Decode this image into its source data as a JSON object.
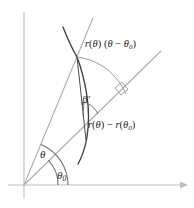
{
  "figure": {
    "background_color": "#ffffff",
    "axis_color": "#b8b8b8",
    "ray_color": "#a8a8a8",
    "curve_color": "#3c3c3c",
    "arc_color": "#8a8a8a",
    "text_color": "#1c1c1c",
    "width": 194,
    "height": 208
  },
  "labels": {
    "arc_length": {
      "function_name": "r",
      "argument": "θ",
      "full_text": "r(θ) (θ − θ₀)",
      "theta": "θ",
      "minus": "−",
      "theta_sub": "0",
      "open_paren": "(",
      "close_paren": ")"
    },
    "radial_difference": {
      "full_text": "r(θ) − r(θ₀)",
      "function_name": "r",
      "theta": "θ",
      "minus": "−",
      "theta_sub": "0"
    },
    "beta_prime": {
      "text": "β′",
      "base": "β",
      "prime": "′"
    },
    "theta": {
      "text": "θ"
    },
    "theta_zero": {
      "base": "θ",
      "subscript": "0",
      "text": "θ₀"
    }
  },
  "geometry": {
    "origin": {
      "x": 24,
      "y": 185
    },
    "x_axis": {
      "x1": 8,
      "y1": 185,
      "x2": 186,
      "y2": 185,
      "arrow": "right"
    },
    "y_axis": {
      "x1": 24,
      "y1": 12,
      "x2": 24,
      "y2": 199,
      "arrow": "none"
    },
    "theta_ray": {
      "x1": 24,
      "y1": 185,
      "x2": 93,
      "y2": 18,
      "angle_deg": 67.5
    },
    "theta0_ray": {
      "x1": 24,
      "y1": 185,
      "x2": 161,
      "y2": 51,
      "angle_deg": 44.4
    },
    "theta_arc_radius": 44,
    "theta0_arc_radius": 34,
    "intersection_point": {
      "x": 77,
      "y": 56
    },
    "outer_arc": {
      "from_x": 77,
      "from_y": 56,
      "to_x": 124,
      "to_y": 93
    },
    "right_angle_marker": {
      "x": 120,
      "y": 90,
      "size": 9
    },
    "beta_arc": {
      "cx": 80,
      "cy": 116,
      "radius": 14
    },
    "curve_label": "spiral r(θ)"
  }
}
